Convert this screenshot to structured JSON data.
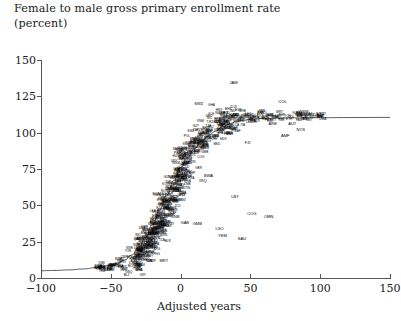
{
  "chart_data": {
    "type": "scatter",
    "title": "Female to male gross primary enrollment rate",
    "subtitle": "(percent)",
    "xlabel": "Adjusted years",
    "ylabel": "",
    "xlim": [
      -100,
      150
    ],
    "ylim": [
      0,
      150
    ],
    "xticks": [
      -100,
      -50,
      0,
      50,
      100,
      150
    ],
    "xtick_labels": [
      "−100",
      "−50",
      "0",
      "50",
      "100",
      "150"
    ],
    "yticks": [
      0,
      25,
      50,
      75,
      100,
      125,
      150
    ],
    "ytick_labels": [
      "0",
      "25",
      "50",
      "75",
      "100",
      "125",
      "150"
    ],
    "grid": false,
    "legend": null,
    "point_style": "country-code-text-labels",
    "fit_curve": {
      "name": "logistic S-curve fit",
      "description": "Smooth monotone curve rising from about 5 percent at -100 adjusted years to a plateau near 110 percent beyond 50 adjusted years",
      "points": [
        [
          -100,
          5
        ],
        [
          -90,
          5.2
        ],
        [
          -80,
          5.6
        ],
        [
          -70,
          6.2
        ],
        [
          -60,
          7.2
        ],
        [
          -50,
          8.8
        ],
        [
          -45,
          10.2
        ],
        [
          -40,
          12.4
        ],
        [
          -35,
          15.8
        ],
        [
          -30,
          21
        ],
        [
          -25,
          28
        ],
        [
          -20,
          37
        ],
        [
          -15,
          47
        ],
        [
          -10,
          57
        ],
        [
          -5,
          67
        ],
        [
          0,
          76
        ],
        [
          5,
          83
        ],
        [
          10,
          89
        ],
        [
          15,
          94
        ],
        [
          20,
          98
        ],
        [
          25,
          101
        ],
        [
          30,
          104
        ],
        [
          35,
          106
        ],
        [
          40,
          107.5
        ],
        [
          45,
          108.5
        ],
        [
          50,
          109.2
        ],
        [
          60,
          109.8
        ],
        [
          70,
          110
        ],
        [
          85,
          110.2
        ],
        [
          100,
          110.3
        ],
        [
          120,
          110.4
        ],
        [
          150,
          110.5
        ]
      ]
    },
    "outlier_labels": [
      {
        "code": "JAM",
        "x": 38,
        "y": 134
      },
      {
        "code": "SWZ",
        "x": 13,
        "y": 120
      },
      {
        "code": "DJI",
        "x": 38,
        "y": 118
      },
      {
        "code": "COL",
        "x": 73,
        "y": 121
      },
      {
        "code": "FIN",
        "x": 57,
        "y": 112
      },
      {
        "code": "WSM",
        "x": 88,
        "y": 114
      },
      {
        "code": "SYC",
        "x": 100,
        "y": 113
      },
      {
        "code": "ARE",
        "x": 66,
        "y": 106
      },
      {
        "code": "AUT",
        "x": 80,
        "y": 106
      },
      {
        "code": "NYS",
        "x": 86,
        "y": 102
      },
      {
        "code": "AMF",
        "x": 75,
        "y": 98
      },
      {
        "code": "FJI",
        "x": 48,
        "y": 93
      },
      {
        "code": "LBY",
        "x": 39,
        "y": 56
      },
      {
        "code": "COG",
        "x": 51,
        "y": 44
      },
      {
        "code": "OMN",
        "x": 63,
        "y": 42
      },
      {
        "code": "SAU",
        "x": 44,
        "y": 27
      },
      {
        "code": "LSO",
        "x": 28,
        "y": 34
      },
      {
        "code": "YEM",
        "x": 30,
        "y": 29
      },
      {
        "code": "MRT",
        "x": -12,
        "y": 12
      },
      {
        "code": "NPL",
        "x": -22,
        "y": 12
      },
      {
        "code": "LSO",
        "x": -34,
        "y": 10
      },
      {
        "code": "MLI",
        "x": -28,
        "y": 9
      },
      {
        "code": "BTN",
        "x": 4,
        "y": 62
      },
      {
        "code": "NER",
        "x": 0,
        "y": 73
      },
      {
        "code": "GNB",
        "x": -4,
        "y": 42
      },
      {
        "code": "GAB",
        "x": 3,
        "y": 38
      },
      {
        "code": "GMB",
        "x": 12,
        "y": 37
      },
      {
        "code": "SOM",
        "x": -17,
        "y": 58
      },
      {
        "code": "AFG",
        "x": -14,
        "y": 47
      },
      {
        "code": "ITA",
        "x": -9,
        "y": 52
      },
      {
        "code": "TGO",
        "x": -12,
        "y": 50
      },
      {
        "code": "IRQ",
        "x": 16,
        "y": 67
      },
      {
        "code": "BWA",
        "x": 20,
        "y": 70
      },
      {
        "code": "PAK",
        "x": -2,
        "y": 86
      },
      {
        "code": "MLI",
        "x": 8,
        "y": 88
      },
      {
        "code": "IND",
        "x": 24,
        "y": 96
      }
    ],
    "n_points": 640
  }
}
